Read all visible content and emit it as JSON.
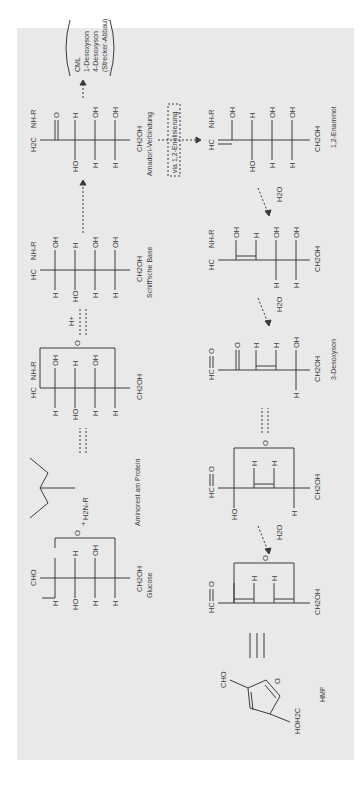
{
  "diagram": {
    "title_hint": "Maillard reaction scheme (rotated 90°)",
    "background": "#e9e9e9",
    "line_color": "#3a3a3a",
    "compounds": {
      "glucose": {
        "label": "Glucose",
        "top": "CHO",
        "bottom": "CH2OH"
      },
      "amino": {
        "label": "Aminorest am Protein",
        "group": "H2N-R",
        "plus": "+"
      },
      "glycosylamine": {
        "top": "HC",
        "substituent": "NH-R",
        "bottom": "CH2OH"
      },
      "schiff": {
        "label": "Schiff'sche Base",
        "top": "HC",
        "substituent": "NH-R",
        "bottom": "CH2OH"
      },
      "amadori": {
        "label": "Amadori-Verbindung",
        "top": "H2C",
        "substituent": "NH-R",
        "bottom": "CH2OH"
      },
      "products": {
        "lines": [
          "CML",
          "1-Desoxyson",
          "4-Desoxyson",
          "(Strecker-Abbau)"
        ]
      },
      "enaminol": {
        "label": "1,2-Enaminol",
        "top": "HC",
        "substituent": "NH-R",
        "bottom": "CH2OH"
      },
      "iminium": {
        "top": "HC",
        "substituent": "NH-R",
        "bottom": "CH2OH"
      },
      "desoxyson3": {
        "label": "3-Desoxyson",
        "top": "HC",
        "bottom": "CH2OH"
      },
      "cyclic1": {
        "top": "HC",
        "bottom": "CH2OH"
      },
      "cyclic2": {
        "top": "HC",
        "bottom": "CH2OH"
      },
      "hmf": {
        "label": "HMF",
        "group1": "CHO",
        "group2": "HOH2C",
        "ring_o": "O"
      }
    },
    "arrows": {
      "h_plus": "H+",
      "water": "H2O",
      "enolization": "via 1,2-Enolisierung"
    },
    "atoms": {
      "H": "H",
      "OH": "OH",
      "HO": "HO",
      "O": "O"
    }
  }
}
